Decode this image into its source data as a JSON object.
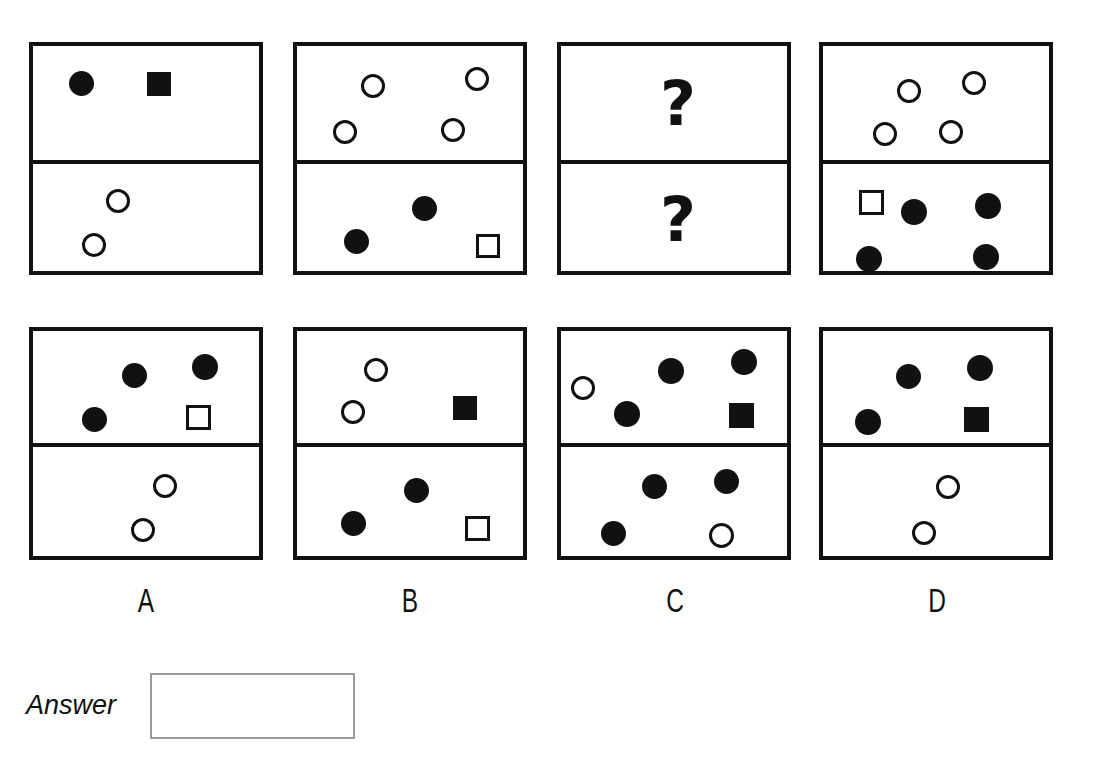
{
  "page": {
    "type": "visual-analogy-matrix-puzzle",
    "background_color": "#ffffff",
    "ink_color": "#111111",
    "width": 1096,
    "height": 776
  },
  "question_mark_glyph": "?",
  "problem_row": {
    "label": "problem-sequence",
    "panels": [
      {
        "id": "problem-panel-1",
        "position": {
          "x": 29,
          "y": 42,
          "w": 234,
          "h": 233
        },
        "divider_y": 118,
        "top_cell": {
          "shapes": [
            {
              "kind": "circle",
              "fill": "filled",
              "cx": 48,
              "cy": 37,
              "size": 25
            },
            {
              "kind": "square",
              "fill": "filled",
              "cx": 126,
              "cy": 38,
              "size": 24
            }
          ]
        },
        "bottom_cell": {
          "shapes": [
            {
              "kind": "circle",
              "fill": "open",
              "cx": 85,
              "cy": 37,
              "size": 24
            },
            {
              "kind": "circle",
              "fill": "open",
              "cx": 61,
              "cy": 81,
              "size": 24
            }
          ]
        }
      },
      {
        "id": "problem-panel-2",
        "position": {
          "x": 293,
          "y": 42,
          "w": 234,
          "h": 233
        },
        "divider_y": 118,
        "top_cell": {
          "shapes": [
            {
              "kind": "circle",
              "fill": "open",
              "cx": 76,
              "cy": 40,
              "size": 24
            },
            {
              "kind": "circle",
              "fill": "open",
              "cx": 180,
              "cy": 33,
              "size": 24
            },
            {
              "kind": "circle",
              "fill": "open",
              "cx": 48,
              "cy": 86,
              "size": 24
            },
            {
              "kind": "circle",
              "fill": "open",
              "cx": 156,
              "cy": 84,
              "size": 24
            }
          ]
        },
        "bottom_cell": {
          "shapes": [
            {
              "kind": "circle",
              "fill": "filled",
              "cx": 127,
              "cy": 44,
              "size": 25
            },
            {
              "kind": "circle",
              "fill": "filled",
              "cx": 59,
              "cy": 77,
              "size": 25
            },
            {
              "kind": "square",
              "fill": "open",
              "cx": 191,
              "cy": 82,
              "size": 24
            }
          ]
        }
      },
      {
        "id": "problem-panel-3-unknown",
        "position": {
          "x": 557,
          "y": 42,
          "w": 234,
          "h": 233
        },
        "divider_y": 118,
        "top_cell": {
          "question_mark": true,
          "cx": 117,
          "cy": 58,
          "font_size": 62
        },
        "bottom_cell": {
          "question_mark": true,
          "cx": 117,
          "cy": 56,
          "font_size": 62
        }
      },
      {
        "id": "problem-panel-4",
        "position": {
          "x": 819,
          "y": 42,
          "w": 234,
          "h": 233
        },
        "divider_y": 118,
        "top_cell": {
          "shapes": [
            {
              "kind": "circle",
              "fill": "open",
              "cx": 86,
              "cy": 45,
              "size": 24
            },
            {
              "kind": "circle",
              "fill": "open",
              "cx": 151,
              "cy": 37,
              "size": 24
            },
            {
              "kind": "circle",
              "fill": "open",
              "cx": 62,
              "cy": 88,
              "size": 24
            },
            {
              "kind": "circle",
              "fill": "open",
              "cx": 128,
              "cy": 86,
              "size": 24
            }
          ]
        },
        "bottom_cell": {
          "shapes": [
            {
              "kind": "square",
              "fill": "open",
              "cx": 48,
              "cy": 38,
              "size": 25
            },
            {
              "kind": "circle",
              "fill": "filled",
              "cx": 91,
              "cy": 48,
              "size": 26
            },
            {
              "kind": "circle",
              "fill": "filled",
              "cx": 165,
              "cy": 42,
              "size": 26
            },
            {
              "kind": "circle",
              "fill": "filled",
              "cx": 46,
              "cy": 95,
              "size": 26
            },
            {
              "kind": "circle",
              "fill": "filled",
              "cx": 163,
              "cy": 93,
              "size": 26
            }
          ]
        }
      }
    ]
  },
  "options_row": {
    "label": "answer-options",
    "panels": [
      {
        "id": "option-panel-a",
        "letter": "A",
        "position": {
          "x": 29,
          "y": 327,
          "w": 234,
          "h": 233
        },
        "divider_y": 116,
        "label_x": 146,
        "label_y": 583,
        "top_cell": {
          "shapes": [
            {
              "kind": "circle",
              "fill": "filled",
              "cx": 101,
              "cy": 44,
              "size": 25
            },
            {
              "kind": "circle",
              "fill": "filled",
              "cx": 172,
              "cy": 36,
              "size": 26
            },
            {
              "kind": "circle",
              "fill": "filled",
              "cx": 61,
              "cy": 88,
              "size": 25
            },
            {
              "kind": "square",
              "fill": "open",
              "cx": 165,
              "cy": 86,
              "size": 25
            }
          ]
        },
        "bottom_cell": {
          "shapes": [
            {
              "kind": "circle",
              "fill": "open",
              "cx": 132,
              "cy": 39,
              "size": 24
            },
            {
              "kind": "circle",
              "fill": "open",
              "cx": 110,
              "cy": 83,
              "size": 24
            }
          ]
        }
      },
      {
        "id": "option-panel-b",
        "letter": "B",
        "position": {
          "x": 293,
          "y": 327,
          "w": 234,
          "h": 233
        },
        "divider_y": 116,
        "label_x": 410,
        "label_y": 583,
        "top_cell": {
          "shapes": [
            {
              "kind": "circle",
              "fill": "open",
              "cx": 79,
              "cy": 39,
              "size": 24
            },
            {
              "kind": "circle",
              "fill": "open",
              "cx": 56,
              "cy": 81,
              "size": 24
            },
            {
              "kind": "square",
              "fill": "filled",
              "cx": 168,
              "cy": 77,
              "size": 24
            }
          ]
        },
        "bottom_cell": {
          "shapes": [
            {
              "kind": "circle",
              "fill": "filled",
              "cx": 119,
              "cy": 43,
              "size": 25
            },
            {
              "kind": "circle",
              "fill": "filled",
              "cx": 56,
              "cy": 76,
              "size": 25
            },
            {
              "kind": "square",
              "fill": "open",
              "cx": 180,
              "cy": 81,
              "size": 25
            }
          ]
        }
      },
      {
        "id": "option-panel-c",
        "letter": "C",
        "position": {
          "x": 557,
          "y": 327,
          "w": 234,
          "h": 233
        },
        "divider_y": 116,
        "label_x": 675,
        "label_y": 583,
        "top_cell": {
          "shapes": [
            {
              "kind": "circle",
              "fill": "open",
              "cx": 22,
              "cy": 57,
              "size": 24
            },
            {
              "kind": "circle",
              "fill": "filled",
              "cx": 110,
              "cy": 40,
              "size": 26
            },
            {
              "kind": "circle",
              "fill": "filled",
              "cx": 183,
              "cy": 31,
              "size": 26
            },
            {
              "kind": "circle",
              "fill": "filled",
              "cx": 66,
              "cy": 83,
              "size": 26
            },
            {
              "kind": "square",
              "fill": "filled",
              "cx": 180,
              "cy": 84,
              "size": 25
            }
          ]
        },
        "bottom_cell": {
          "shapes": [
            {
              "kind": "circle",
              "fill": "filled",
              "cx": 93,
              "cy": 39,
              "size": 25
            },
            {
              "kind": "circle",
              "fill": "filled",
              "cx": 165,
              "cy": 34,
              "size": 25
            },
            {
              "kind": "circle",
              "fill": "filled",
              "cx": 52,
              "cy": 86,
              "size": 25
            },
            {
              "kind": "circle",
              "fill": "open",
              "cx": 160,
              "cy": 88,
              "size": 25
            }
          ]
        }
      },
      {
        "id": "option-panel-d",
        "letter": "D",
        "position": {
          "x": 819,
          "y": 327,
          "w": 234,
          "h": 233
        },
        "divider_y": 116,
        "label_x": 937,
        "label_y": 583,
        "top_cell": {
          "shapes": [
            {
              "kind": "circle",
              "fill": "filled",
              "cx": 85,
              "cy": 45,
              "size": 25
            },
            {
              "kind": "circle",
              "fill": "filled",
              "cx": 157,
              "cy": 37,
              "size": 26
            },
            {
              "kind": "circle",
              "fill": "filled",
              "cx": 45,
              "cy": 91,
              "size": 26
            },
            {
              "kind": "square",
              "fill": "filled",
              "cx": 153,
              "cy": 88,
              "size": 25
            }
          ]
        },
        "bottom_cell": {
          "shapes": [
            {
              "kind": "circle",
              "fill": "open",
              "cx": 125,
              "cy": 40,
              "size": 24
            },
            {
              "kind": "circle",
              "fill": "open",
              "cx": 101,
              "cy": 86,
              "size": 24
            }
          ]
        }
      }
    ]
  },
  "answer_field": {
    "label": "Answer",
    "value": "",
    "placeholder": ""
  }
}
